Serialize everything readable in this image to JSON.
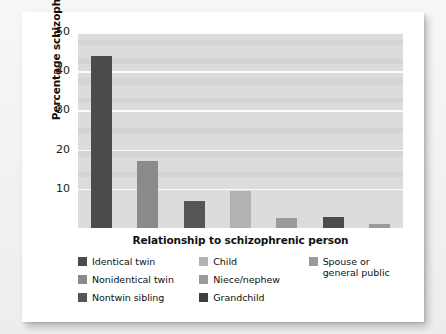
{
  "figure": {
    "ylabel": "Percentage schizophrenic",
    "xlabel": "Relationship to schizophrenic person"
  },
  "chart_data": {
    "type": "bar",
    "title": "",
    "xlabel": "Relationship to schizophrenic person",
    "ylabel": "Percentage schizophrenic",
    "ylim": [
      0,
      50
    ],
    "yticks": [
      10,
      20,
      30,
      40,
      50
    ],
    "grid": true,
    "legend_position": "bottom",
    "categories": [
      "Identical twin",
      "Nonidentical twin",
      "Nontwin sibling",
      "Child",
      "Niece/nephew",
      "Grandchild",
      "Spouse or general public"
    ],
    "values": [
      44,
      17,
      7,
      9.5,
      2.5,
      2.8,
      1
    ],
    "colors": [
      "#4b4b4b",
      "#8a8a8a",
      "#555555",
      "#b2b2b2",
      "#9a9a9a",
      "#4b4b4b",
      "#9a9a9a"
    ],
    "plot_background": "#dcdcdc",
    "gridline_color": "#fbfbfb"
  },
  "legend": {
    "columns": [
      [
        {
          "label": "Identical twin",
          "color": "#4b4b4b"
        },
        {
          "label": "Nonidentical twin",
          "color": "#8a8a8a"
        },
        {
          "label": "Nontwin sibling",
          "color": "#555555"
        }
      ],
      [
        {
          "label": "Child",
          "color": "#b2b2b2"
        },
        {
          "label": "Niece/nephew",
          "color": "#9a9a9a"
        },
        {
          "label": "Grandchild",
          "color": "#3f3f3f"
        }
      ],
      [
        {
          "label": "Spouse or\ngeneral public",
          "color": "#9a9a9a"
        }
      ]
    ]
  }
}
